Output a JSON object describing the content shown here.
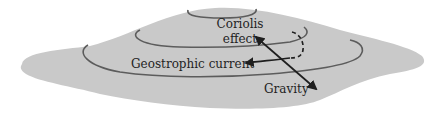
{
  "diagram": {
    "labels": {
      "coriolis_line1": "Coriolis",
      "coriolis_line2": "effect",
      "geostrophic": "Geostrophic current",
      "gravity": "Gravity"
    },
    "colors": {
      "mound_fill": "#c9c9c9",
      "contour": "#5c5c5c",
      "arrow": "#1e1e1e",
      "background": "#ffffff"
    }
  }
}
